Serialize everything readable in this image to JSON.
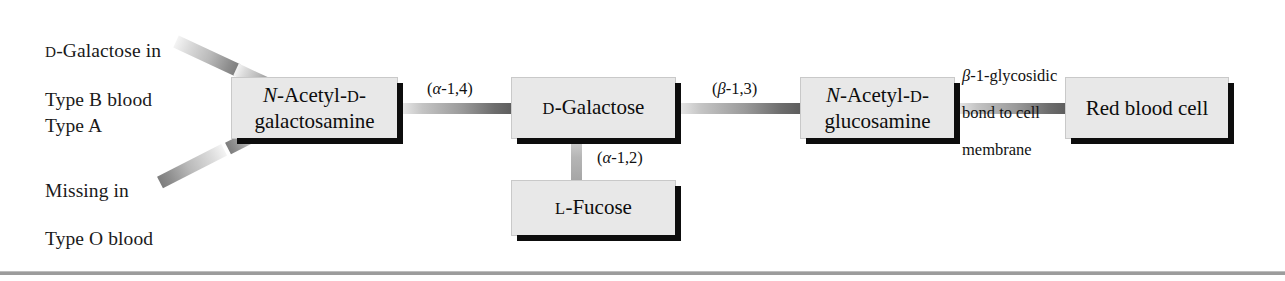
{
  "figure": {
    "type": "blood-group-antigen-structure-diagram",
    "width": 1285,
    "height": 281,
    "background_color": "#ffffff",
    "box_fill_color": "#e8e8e8",
    "box_shadow_color": "#0d0d0d",
    "connector_color": "#8e8e8e"
  },
  "annotations": [
    {
      "id": "galactose-type-b",
      "text": "D-Galactose in\nType B blood",
      "line1_small_caps": "D",
      "line1_rest": "-Galactose in",
      "line2": "Type B blood"
    },
    {
      "id": "type-a",
      "text": "Type A"
    },
    {
      "id": "missing-type-o",
      "text": "Missing in\nType O blood",
      "line1": "Missing in",
      "line2": "Type O blood"
    }
  ],
  "nodes": [
    {
      "id": "n-acetyl-d-galactosamine",
      "line1_italic": "N",
      "line1_rest": "-Acetyl-",
      "line1_small_caps": "D",
      "line1_tail": "-",
      "line2": "galactosamine",
      "plain_text": "N-Acetyl-D-galactosamine"
    },
    {
      "id": "d-galactose",
      "small_caps": "D",
      "rest": "-Galactose",
      "plain_text": "D-Galactose"
    },
    {
      "id": "n-acetyl-d-glucosamine",
      "line1_italic": "N",
      "line1_rest": "-Acetyl-",
      "line1_small_caps": "D",
      "line1_tail": "-",
      "line2": "glucosamine",
      "plain_text": "N-Acetyl-D-glucosamine"
    },
    {
      "id": "red-blood-cell",
      "text": "Red blood cell"
    },
    {
      "id": "l-fucose",
      "small_caps": "L",
      "rest": "-Fucose",
      "plain_text": "L-Fucose"
    }
  ],
  "bonds": [
    {
      "id": "alpha-1-4",
      "open": "(",
      "greek": "α",
      "rest": "-1,4)",
      "plain_text": "(α-1,4)"
    },
    {
      "id": "beta-1-3",
      "open": "(",
      "greek": "β",
      "rest": "-1,3)",
      "plain_text": "(β-1,3)"
    },
    {
      "id": "alpha-1-2",
      "open": "(",
      "greek": "α",
      "rest": "-1,2)",
      "plain_text": "(α-1,2)"
    },
    {
      "id": "beta-1-glycosidic-membrane",
      "greek": "β",
      "line1_rest": "-1-glycosidic",
      "line2": "bond to cell",
      "line3": "membrane",
      "plain_text": "β-1-glycosidic bond to cell membrane"
    }
  ]
}
